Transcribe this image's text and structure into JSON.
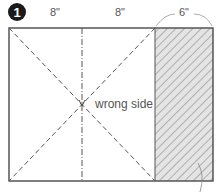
{
  "diagram": {
    "step_number": "1",
    "dimensions": [
      {
        "id": "left-panel",
        "label": "8\""
      },
      {
        "id": "middle-panel",
        "label": "8\""
      },
      {
        "id": "right-panel",
        "label": "6\""
      }
    ],
    "center_label": "wrong side",
    "colors": {
      "outline": "#555555",
      "hatch": "#888888",
      "hatch_fill": "#e4e4e4",
      "badge": "#1a1a1a"
    }
  }
}
